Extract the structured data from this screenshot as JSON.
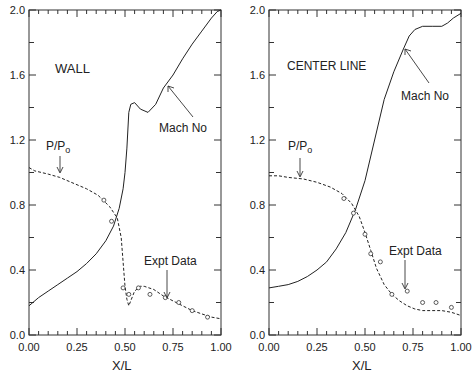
{
  "chart_data": [
    {
      "type": "line",
      "panel": "left",
      "title": "WALL",
      "xlabel": "X/L",
      "ylabel": "",
      "xlim": [
        0,
        1
      ],
      "ylim": [
        0,
        2
      ],
      "xticks": [
        "0.00",
        "0.25",
        "0.50",
        "0.75",
        "1.00"
      ],
      "yticks": [
        "0.0",
        "0.4",
        "0.8",
        "1.2",
        "1.6",
        "2.0"
      ],
      "series": [
        {
          "name": "Mach No",
          "style": "solid",
          "x": [
            0.0,
            0.05,
            0.1,
            0.15,
            0.2,
            0.25,
            0.3,
            0.35,
            0.4,
            0.44,
            0.47,
            0.49,
            0.5,
            0.51,
            0.52,
            0.53,
            0.55,
            0.58,
            0.62,
            0.66,
            0.7,
            0.75,
            0.8,
            0.85,
            0.9,
            0.95,
            0.98,
            1.0
          ],
          "y": [
            0.18,
            0.23,
            0.27,
            0.31,
            0.35,
            0.39,
            0.44,
            0.5,
            0.58,
            0.67,
            0.78,
            0.9,
            1.0,
            1.15,
            1.37,
            1.42,
            1.43,
            1.39,
            1.37,
            1.42,
            1.52,
            1.6,
            1.7,
            1.79,
            1.87,
            1.95,
            1.99,
            2.0
          ]
        },
        {
          "name": "P/Po",
          "style": "dashed",
          "x": [
            0.0,
            0.03,
            0.1,
            0.16,
            0.22,
            0.3,
            0.36,
            0.42,
            0.46,
            0.48,
            0.49,
            0.5,
            0.51,
            0.52,
            0.55,
            0.58,
            0.6,
            0.65,
            0.7,
            0.75,
            0.8,
            0.85,
            0.9,
            0.95,
            1.0
          ],
          "y": [
            1.03,
            1.01,
            0.99,
            0.97,
            0.94,
            0.9,
            0.86,
            0.79,
            0.72,
            0.6,
            0.45,
            0.3,
            0.22,
            0.18,
            0.27,
            0.3,
            0.3,
            0.28,
            0.24,
            0.21,
            0.18,
            0.15,
            0.13,
            0.11,
            0.1
          ]
        },
        {
          "name": "Expt Data",
          "style": "markers",
          "x": [
            0.39,
            0.43,
            0.49,
            0.52,
            0.57,
            0.63,
            0.71,
            0.78,
            0.85,
            0.93
          ],
          "y": [
            0.83,
            0.7,
            0.29,
            0.25,
            0.29,
            0.25,
            0.23,
            0.2,
            0.15,
            0.11
          ]
        }
      ],
      "annotations": [
        "WALL",
        "P/Po",
        "Mach No",
        "Expt Data"
      ]
    },
    {
      "type": "line",
      "panel": "right",
      "title": "CENTER LINE",
      "xlabel": "X/L",
      "ylabel": "",
      "xlim": [
        0,
        1
      ],
      "ylim": [
        0,
        2
      ],
      "xticks": [
        "0.00",
        "0.25",
        "0.50",
        "0.75",
        "1.00"
      ],
      "yticks": [
        "0.0",
        "0.4",
        "0.8",
        "1.2",
        "1.6",
        "2.0"
      ],
      "series": [
        {
          "name": "Mach No",
          "style": "solid",
          "x": [
            0.0,
            0.05,
            0.1,
            0.15,
            0.2,
            0.25,
            0.3,
            0.35,
            0.4,
            0.45,
            0.5,
            0.55,
            0.6,
            0.65,
            0.7,
            0.73,
            0.76,
            0.8,
            0.85,
            0.9,
            0.93,
            0.96,
            1.0
          ],
          "y": [
            0.29,
            0.3,
            0.31,
            0.33,
            0.36,
            0.4,
            0.45,
            0.53,
            0.63,
            0.77,
            0.95,
            1.2,
            1.45,
            1.62,
            1.76,
            1.84,
            1.88,
            1.9,
            1.9,
            1.9,
            1.92,
            1.95,
            1.98
          ]
        },
        {
          "name": "P/Po",
          "style": "dashed",
          "x": [
            0.0,
            0.05,
            0.1,
            0.18,
            0.25,
            0.32,
            0.38,
            0.43,
            0.47,
            0.5,
            0.53,
            0.56,
            0.6,
            0.64,
            0.68,
            0.72,
            0.76,
            0.8,
            0.85,
            0.9,
            0.95,
            1.0
          ],
          "y": [
            0.98,
            0.98,
            0.97,
            0.96,
            0.94,
            0.91,
            0.87,
            0.81,
            0.73,
            0.63,
            0.52,
            0.41,
            0.31,
            0.25,
            0.21,
            0.18,
            0.16,
            0.15,
            0.15,
            0.15,
            0.14,
            0.12
          ]
        },
        {
          "name": "Expt Data",
          "style": "markers",
          "x": [
            0.39,
            0.44,
            0.5,
            0.53,
            0.58,
            0.64,
            0.72,
            0.8,
            0.87,
            0.95
          ],
          "y": [
            0.84,
            0.75,
            0.62,
            0.5,
            0.45,
            0.25,
            0.27,
            0.2,
            0.2,
            0.17
          ]
        }
      ],
      "annotations": [
        "CENTER LINE",
        "P/Po",
        "Mach No",
        "Expt Data"
      ]
    }
  ],
  "labels": {
    "left_title": "WALL",
    "right_title": "CENTER LINE",
    "pressure": "P/P",
    "pressure_sub": "o",
    "mach": "Mach No",
    "expt": "Expt Data",
    "xlabel": "X/L"
  }
}
